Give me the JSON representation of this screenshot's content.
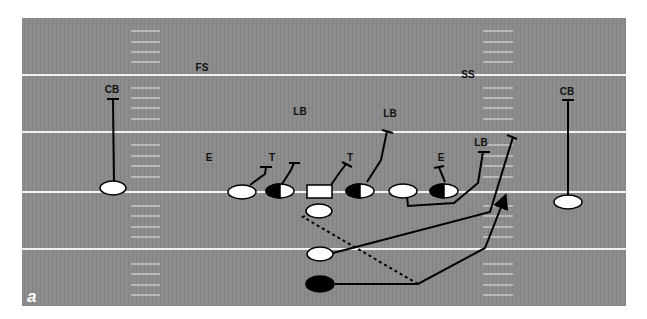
{
  "figure": {
    "panel_label": "a",
    "field_color": "#8a8a8a",
    "line_color": "#f2f2f2",
    "ink_color": "#000000"
  },
  "defense_labels": [
    {
      "id": "cb-left",
      "text": "CB",
      "x": 112,
      "y": 93
    },
    {
      "id": "fs",
      "text": "FS",
      "x": 202,
      "y": 71
    },
    {
      "id": "ss",
      "text": "SS",
      "x": 468,
      "y": 78
    },
    {
      "id": "cb-right",
      "text": "CB",
      "x": 567,
      "y": 95
    },
    {
      "id": "lb-left",
      "text": "LB",
      "x": 300,
      "y": 115
    },
    {
      "id": "lb-mid",
      "text": "LB",
      "x": 390,
      "y": 117
    },
    {
      "id": "lb-right",
      "text": "LB",
      "x": 481,
      "y": 146
    },
    {
      "id": "e-left",
      "text": "E",
      "x": 209,
      "y": 161
    },
    {
      "id": "t-left",
      "text": "T",
      "x": 272,
      "y": 161
    },
    {
      "id": "t-right",
      "text": "T",
      "x": 350,
      "y": 161
    },
    {
      "id": "e-right",
      "text": "E",
      "x": 441,
      "y": 161
    }
  ],
  "offense_players": [
    {
      "id": "wr-left",
      "shape": "ellipse",
      "fill": "white"
    },
    {
      "id": "tackle-left",
      "shape": "ellipse",
      "fill": "white"
    },
    {
      "id": "guard-left",
      "shape": "ellipse",
      "fill": "half"
    },
    {
      "id": "center",
      "shape": "rect",
      "fill": "white"
    },
    {
      "id": "guard-right",
      "shape": "ellipse",
      "fill": "half"
    },
    {
      "id": "tackle-right",
      "shape": "ellipse",
      "fill": "white"
    },
    {
      "id": "tight-end",
      "shape": "ellipse",
      "fill": "half"
    },
    {
      "id": "wr-right",
      "shape": "ellipse",
      "fill": "white"
    },
    {
      "id": "quarterback",
      "shape": "ellipse",
      "fill": "white"
    },
    {
      "id": "fullback",
      "shape": "ellipse",
      "fill": "white"
    },
    {
      "id": "tailback",
      "shape": "ellipse",
      "fill": "black"
    }
  ]
}
